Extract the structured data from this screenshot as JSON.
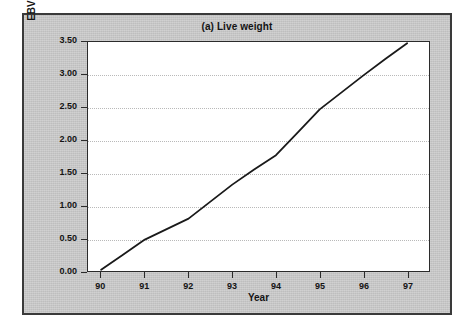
{
  "chart_data": {
    "type": "line",
    "title": "(a) Live weight",
    "xlabel": "Year",
    "ylabel": "EBV for live weight (kg)",
    "xlim": [
      89.7,
      97.5
    ],
    "ylim": [
      0.0,
      3.5
    ],
    "grid": true,
    "legend": null,
    "x_tick_labels": [
      "90",
      "91",
      "92",
      "93",
      "94",
      "95",
      "96",
      "97"
    ],
    "x_tick_values": [
      90,
      91,
      92,
      93,
      94,
      95,
      96,
      97
    ],
    "y_tick_labels": [
      "0.00",
      "0.50",
      "1.00",
      "1.50",
      "2.00",
      "2.50",
      "3.00",
      "3.50"
    ],
    "y_tick_values": [
      0.0,
      0.5,
      1.0,
      1.5,
      2.0,
      2.5,
      3.0,
      3.5
    ],
    "series": [
      {
        "name": "EBV for live weight",
        "color": "#1a1a1a",
        "x": [
          90.0,
          90.5,
          91.0,
          91.5,
          92.0,
          92.5,
          93.0,
          93.5,
          94.0,
          94.5,
          95.0,
          95.5,
          96.0,
          96.5,
          97.0
        ],
        "values": [
          0.02,
          0.25,
          0.48,
          0.64,
          0.8,
          1.06,
          1.32,
          1.55,
          1.77,
          2.12,
          2.47,
          2.73,
          2.99,
          3.24,
          3.48
        ]
      }
    ]
  },
  "figure": {
    "panel_color": "#c8c8c8",
    "plot_background": "#ffffff",
    "line_color": "#1a1a1a",
    "gridline_color": "#b9b9b9",
    "axis_color": "#2b2b2b"
  }
}
